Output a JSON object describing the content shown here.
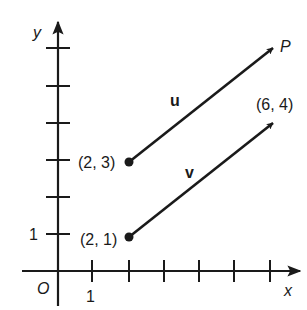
{
  "figure": {
    "axes": {
      "x_label": "x",
      "y_label": "y",
      "origin_label": "O",
      "x_tick_label": "1",
      "y_tick_label": "1",
      "x_ticks": [
        1,
        2,
        3,
        4,
        5,
        6
      ],
      "y_ticks": [
        1,
        2,
        3,
        4,
        5,
        6
      ]
    },
    "vectors": [
      {
        "name": "u",
        "label": "u",
        "start": [
          2,
          3
        ],
        "end": [
          6,
          6
        ],
        "start_label": "(2, 3)",
        "end_label": "P"
      },
      {
        "name": "v",
        "label": "v",
        "start": [
          2,
          1
        ],
        "end": [
          6,
          4
        ],
        "start_label": "(2, 1)",
        "end_label": "(6, 4)"
      }
    ],
    "colors": {
      "ink": "#1a1a1a",
      "background": "#ffffff"
    }
  }
}
